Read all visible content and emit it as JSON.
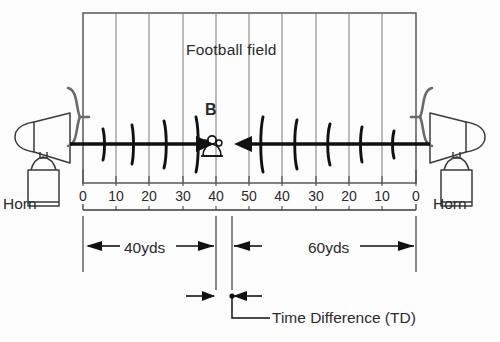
{
  "figure": {
    "field_title": "Football field",
    "observer_marker": "B",
    "time_difference_label": "Time Difference (TD)",
    "left_source_label": "Horn",
    "right_source_label": "Horn",
    "left_distance_label": "40yds",
    "right_distance_label": "60yds",
    "yard_scale": [
      "0",
      "10",
      "20",
      "30",
      "40",
      "50",
      "40",
      "30",
      "20",
      "10",
      "0"
    ],
    "colors": {
      "ink": "#1a1a1a",
      "line": "#2b2b2b",
      "grid": "#6a6a6a",
      "background": "#fdfdfd"
    },
    "icons": {
      "left_source": "air-horn-icon",
      "right_source": "air-horn-icon",
      "left_wave_bracket": "sound-bracket-icon",
      "right_wave_bracket": "sound-bracket-icon",
      "observer": "listener-person-icon",
      "time_difference_point": "measurement-dot-icon"
    }
  },
  "chart_data": {
    "type": "diagram",
    "title": "Football field",
    "xlabel": "Yard line markers",
    "categories": [
      "0",
      "10",
      "20",
      "30",
      "40",
      "50",
      "40",
      "30",
      "20",
      "10",
      "0"
    ],
    "x_positions_px": [
      83,
      116,
      149,
      183,
      216,
      249,
      282,
      316,
      349,
      382,
      416
    ],
    "annotations": [
      {
        "name": "left-segment",
        "label": "40yds",
        "value": 40,
        "units": "yds",
        "from": "0",
        "to": "40"
      },
      {
        "name": "right-segment",
        "label": "60yds",
        "value": 60,
        "units": "yds",
        "from": "50",
        "to": "0"
      },
      {
        "name": "time-difference",
        "label": "Time Difference (TD)"
      }
    ],
    "series": [
      {
        "name": "left-horn-sound-front",
        "direction": "rightward",
        "origin": "left Horn"
      },
      {
        "name": "right-horn-sound-front",
        "direction": "leftward",
        "origin": "right Horn"
      }
    ],
    "grid": true,
    "legend": "none"
  }
}
